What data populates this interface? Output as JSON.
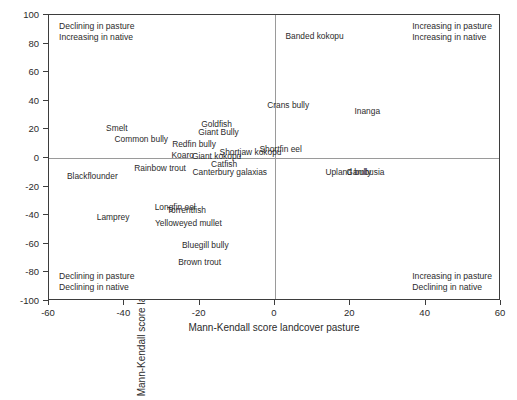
{
  "chart_data": {
    "type": "scatter",
    "title": "",
    "xlabel": "Mann-Kendall score landcover pasture",
    "ylabel": "Mann-Kendall score landcover native",
    "xlim": [
      -60,
      60
    ],
    "ylim": [
      -100,
      100
    ],
    "xticks": [
      -60,
      -40,
      -20,
      0,
      20,
      40,
      60
    ],
    "yticks": [
      -100,
      -80,
      -60,
      -40,
      -20,
      0,
      20,
      40,
      60,
      80,
      100
    ],
    "xtick_labels": [
      "-60",
      "-40",
      "-20",
      "0",
      "20",
      "40",
      "60"
    ],
    "ytick_labels": [
      "-100",
      "-80",
      "-60",
      "-40",
      "-20",
      "0",
      "20",
      "40",
      "60",
      "80",
      "100"
    ],
    "grid": false,
    "legend": null,
    "reference_lines": [
      {
        "axis": "y",
        "value": 0
      },
      {
        "axis": "x",
        "value": 0
      }
    ],
    "marker_style": "label-only",
    "points": [
      {
        "label": "Smelt",
        "x": -42.0,
        "y": 21.0
      },
      {
        "label": "Common bully",
        "x": -35.5,
        "y": 13.5
      },
      {
        "label": "Redfin bully",
        "x": -21.5,
        "y": 9.5
      },
      {
        "label": "Goldfish",
        "x": -15.5,
        "y": 24.0
      },
      {
        "label": "Giant Bully",
        "x": -15.0,
        "y": 18.0
      },
      {
        "label": "Koaro",
        "x": -24.5,
        "y": 2.0
      },
      {
        "label": "Giant kokopu",
        "x": -15.5,
        "y": 1.5
      },
      {
        "label": "Shortjaw kokopu",
        "x": -6.5,
        "y": 4.5
      },
      {
        "label": "Shortfin eel",
        "x": 1.5,
        "y": 6.0
      },
      {
        "label": "Catfish",
        "x": -13.5,
        "y": -4.0
      },
      {
        "label": "Canterbury galaxias",
        "x": -12.0,
        "y": -9.5
      },
      {
        "label": "Rainbow trout",
        "x": -30.5,
        "y": -7.0
      },
      {
        "label": "Blackflounder",
        "x": -48.5,
        "y": -12.5
      },
      {
        "label": "Longfin eel",
        "x": -26.5,
        "y": -34.0
      },
      {
        "label": "Torrentfish",
        "x": -23.5,
        "y": -36.5
      },
      {
        "label": "Lamprey",
        "x": -43.0,
        "y": -41.0
      },
      {
        "label": "Yelloweyed mullet",
        "x": -23.0,
        "y": -45.5
      },
      {
        "label": "Bluegill bully",
        "x": -18.5,
        "y": -60.5
      },
      {
        "label": "Brown trout",
        "x": -20.0,
        "y": -73.0
      },
      {
        "label": "Banded kokopu",
        "x": 10.5,
        "y": 85.5
      },
      {
        "label": "Crans bully",
        "x": 3.5,
        "y": 37.0
      },
      {
        "label": "Inanga",
        "x": 24.5,
        "y": 33.0
      },
      {
        "label": "Upland bully",
        "x": 19.5,
        "y": -9.5
      },
      {
        "label": "Gambusia",
        "x": 24.0,
        "y": -9.5
      }
    ],
    "quadrant_annotations": {
      "top_left": [
        "Declining in pasture",
        "Increasing in native"
      ],
      "top_right": [
        "Increasing in pasture",
        "Increasing in native"
      ],
      "bottom_left": [
        "Declining in pasture",
        "Declining in native"
      ],
      "bottom_right": [
        "Increasing in pasture",
        "Declining in native"
      ]
    }
  },
  "caption": ""
}
